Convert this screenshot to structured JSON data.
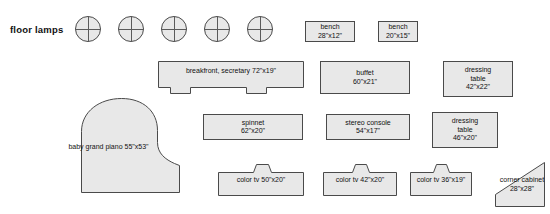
{
  "section": {
    "label": "floor lamps",
    "lamp_icon": "floor-lamp-circle",
    "lamp_count": 5
  },
  "palette": {
    "fill": "#e8e8e8",
    "stroke": "#4a4a4a",
    "text": "#111111",
    "page": "#ffffff"
  },
  "pieces": [
    {
      "id": "bench-1",
      "name": "bench",
      "dim": "28\"x12\""
    },
    {
      "id": "bench-2",
      "name": "bench",
      "dim": "20\"x15\""
    },
    {
      "id": "breakfront",
      "name": "breakfront, secretary",
      "dim": "72\"x19\""
    },
    {
      "id": "buffet",
      "name": "buffet",
      "dim": "60\"x21\""
    },
    {
      "id": "dressing-table-1",
      "name": "dressing table",
      "name_l1": "dressing",
      "name_l2": "table",
      "dim": "42\"x22\""
    },
    {
      "id": "baby-grand-piano",
      "name": "baby grand piano",
      "name_l1": "baby grand",
      "name_l2": "piano",
      "dim": "55\"x53\""
    },
    {
      "id": "spinnet",
      "name": "spinnet",
      "dim": "62\"x20\""
    },
    {
      "id": "stereo-console",
      "name": "stereo console",
      "dim": "54\"x17\""
    },
    {
      "id": "dressing-table-2",
      "name": "dressing table",
      "name_l1": "dressing",
      "name_l2": "table",
      "dim": "46\"x20\""
    },
    {
      "id": "color-tv-1",
      "name": "color tv",
      "dim": "50\"x20\""
    },
    {
      "id": "color-tv-2",
      "name": "color tv",
      "dim": "42\"x20\""
    },
    {
      "id": "color-tv-3",
      "name": "color tv",
      "dim": "36\"x19\""
    },
    {
      "id": "corner-cabinet",
      "name": "corner cabinet",
      "name_l1": "corner",
      "name_l2": "cabinet",
      "dim": "28\"x28\""
    }
  ]
}
